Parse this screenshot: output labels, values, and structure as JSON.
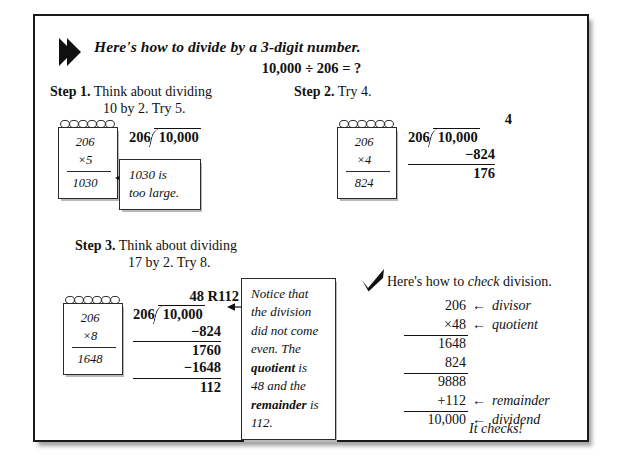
{
  "page": {
    "header_icon": "right-arrow-pointer-icon",
    "title": "Here's how to divide by a 3-digit number.",
    "equation": "10,000 ÷ 206 = ?"
  },
  "steps": [
    {
      "id": "step-1",
      "label": "Step 1.",
      "text_line1": "Think about dividing",
      "text_line2": "10 by 2. Try 5.",
      "notepad": {
        "multiplicand": "206",
        "multiplier": "×5",
        "product": "1030"
      },
      "division": {
        "quotient": "",
        "divisor": "206",
        "dividend": "10,000",
        "rows": []
      },
      "callout": {
        "line1": "1030 is",
        "line2": "too large."
      }
    },
    {
      "id": "step-2",
      "label": "Step 2.",
      "text_line1": "Try 4.",
      "text_line2": "",
      "notepad": {
        "multiplicand": "206",
        "multiplier": "×4",
        "product": "824"
      },
      "division": {
        "quotient": "4",
        "divisor": "206",
        "dividend": "10,000",
        "rows": [
          {
            "value": "−824",
            "ruled": true
          },
          {
            "value": "176",
            "ruled": false
          }
        ]
      }
    },
    {
      "id": "step-3",
      "label": "Step 3.",
      "text_line1": "Think about dividing",
      "text_line2": "17 by 2. Try 8.",
      "notepad": {
        "multiplicand": "206",
        "multiplier": "×8",
        "product": "1648"
      },
      "division": {
        "quotient": "48 R112",
        "divisor": "206",
        "dividend": "10,000",
        "rows": [
          {
            "value": "−824",
            "ruled": true
          },
          {
            "value": "1760",
            "ruled": false
          },
          {
            "value": "−1648",
            "ruled": true
          },
          {
            "value": "112",
            "ruled": false
          }
        ]
      },
      "callout": {
        "line1": "Notice that",
        "line2": "the division",
        "line3": "did not come",
        "line4": "even. The",
        "line5_bold": "quotient",
        "line5_rest": " is",
        "line6": "48 and the",
        "line7_bold": "remainder",
        "line7_rest": " is",
        "line8": "112."
      }
    }
  ],
  "check": {
    "icon": "checkmark-icon",
    "heading_pre": "Here's how to ",
    "heading_em": "check",
    "heading_post": " division.",
    "rows": [
      {
        "value": "206",
        "ruled": false,
        "arrow": "←",
        "label": "divisor"
      },
      {
        "value": "×48",
        "ruled": true,
        "arrow": "←",
        "label": "quotient"
      },
      {
        "value": "1648",
        "ruled": false,
        "arrow": "",
        "label": ""
      },
      {
        "value": "824",
        "ruled": true,
        "arrow": "",
        "label": ""
      },
      {
        "value": "9888",
        "ruled": false,
        "arrow": "",
        "label": ""
      },
      {
        "value": "+112",
        "ruled": true,
        "arrow": "←",
        "label": "remainder"
      },
      {
        "value": "10,000",
        "ruled": false,
        "arrow": "←",
        "label": "dividend"
      }
    ],
    "footer": "It checks!"
  },
  "colors": {
    "ink": "#111111",
    "border": "#1a1a1a",
    "paper": "#ffffff"
  }
}
